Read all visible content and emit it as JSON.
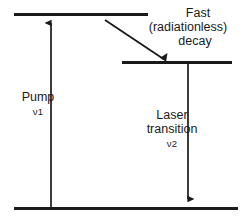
{
  "diagram": {
    "stroke_color": "#1a1a1a",
    "background_color": "#ffffff",
    "levels": [
      {
        "name": "upper-pump-level",
        "y": 14,
        "x1": 14,
        "x2": 148
      },
      {
        "name": "upper-laser-level",
        "y": 62,
        "x1": 122,
        "x2": 232
      },
      {
        "name": "ground-level",
        "y": 208,
        "x1": 14,
        "x2": 238
      }
    ],
    "transitions": [
      {
        "name": "pump",
        "label": "Pump",
        "frequency_symbol": "ν",
        "frequency_index": "1",
        "frequency_label": "ν1",
        "direction": "up",
        "x": 51,
        "y_start": 207,
        "y_end": 19
      },
      {
        "name": "fast-radiationless-decay",
        "label_line1": "Fast",
        "label_line2": "(radiationless)",
        "label_line3": "decay",
        "direction": "diagonal-down-right",
        "x_start": 105,
        "y_start": 20,
        "x_end": 166,
        "y_end": 61
      },
      {
        "name": "laser-transition",
        "label_line1": "Laser",
        "label_line2": "transition",
        "frequency_symbol": "ν",
        "frequency_index": "2",
        "frequency_label": "ν2",
        "direction": "down",
        "x": 188,
        "y_start": 64,
        "y_end": 204
      }
    ]
  },
  "labels": {
    "decay": {
      "line1": "Fast",
      "line2": "(radiationless)",
      "line3": "decay"
    },
    "pump": {
      "line1": "Pump",
      "nu": "ν1"
    },
    "laser": {
      "line1": "Laser",
      "line2": "transition",
      "nu": "ν2"
    }
  }
}
